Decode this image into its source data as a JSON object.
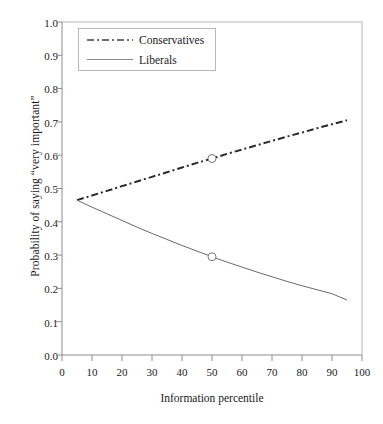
{
  "chart_data": {
    "type": "line",
    "title": "",
    "xlabel": "Information percentile",
    "ylabel": "Probability of saying “very important”",
    "xlim": [
      0,
      100
    ],
    "ylim": [
      0.0,
      1.0
    ],
    "grid": false,
    "legend_position": "top-left-inside",
    "xticks": [
      "0",
      "10",
      "20",
      "30",
      "40",
      "50",
      "60",
      "70",
      "80",
      "90",
      "100"
    ],
    "xtick_values": [
      0,
      10,
      20,
      30,
      40,
      50,
      60,
      70,
      80,
      90,
      100
    ],
    "yticks": [
      "0.0",
      "0.1",
      "0.2",
      "0.3",
      "0.4",
      "0.5",
      "0.6",
      "0.7",
      "0.8",
      "0.9",
      "1.0"
    ],
    "ytick_values": [
      0.0,
      0.1,
      0.2,
      0.3,
      0.4,
      0.5,
      0.6,
      0.7,
      0.8,
      0.9,
      1.0
    ],
    "series": [
      {
        "name": "Conservatives",
        "style": "dash-dot",
        "color": "#2b2b2b",
        "marker": "open-circle",
        "marker_points": [
          {
            "x": 50,
            "y": 0.59
          }
        ],
        "x": [
          5,
          10,
          15,
          20,
          25,
          30,
          35,
          40,
          45,
          50,
          55,
          60,
          65,
          70,
          75,
          80,
          85,
          90,
          95
        ],
        "values": [
          0.465,
          0.479,
          0.493,
          0.507,
          0.521,
          0.535,
          0.549,
          0.563,
          0.577,
          0.59,
          0.604,
          0.617,
          0.63,
          0.643,
          0.656,
          0.668,
          0.681,
          0.693,
          0.705
        ]
      },
      {
        "name": "Liberals",
        "style": "solid",
        "color": "#6b6b6b",
        "marker": "open-circle",
        "marker_points": [
          {
            "x": 50,
            "y": 0.295
          }
        ],
        "x": [
          5,
          10,
          15,
          20,
          25,
          30,
          35,
          40,
          45,
          50,
          55,
          60,
          65,
          70,
          75,
          80,
          85,
          90,
          95
        ],
        "values": [
          0.465,
          0.444,
          0.424,
          0.404,
          0.384,
          0.365,
          0.347,
          0.329,
          0.312,
          0.295,
          0.279,
          0.264,
          0.249,
          0.235,
          0.221,
          0.208,
          0.196,
          0.184,
          0.165
        ]
      }
    ]
  },
  "legend": {
    "items": [
      {
        "label": "Conservatives",
        "style": "dash-dot"
      },
      {
        "label": "Liberals",
        "style": "solid"
      }
    ]
  }
}
